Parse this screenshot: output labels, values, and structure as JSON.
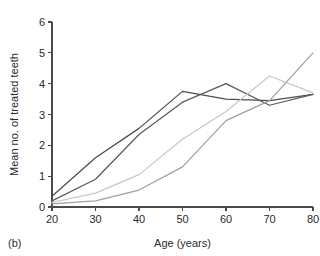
{
  "figure": {
    "panel_label": "(b)"
  },
  "chart_data": {
    "type": "line",
    "title": "",
    "xlabel": "Age (years)",
    "ylabel": "Mean no. of treated teeth",
    "x": [
      20,
      30,
      40,
      50,
      60,
      70,
      80
    ],
    "xlim": [
      20,
      80
    ],
    "ylim": [
      0,
      6
    ],
    "xticks": [
      20,
      30,
      40,
      50,
      60,
      70,
      80
    ],
    "yticks": [
      0,
      1,
      2,
      3,
      4,
      5,
      6
    ],
    "xtick_labels": [
      "20",
      "30",
      "40",
      "50",
      "60",
      "70",
      "80"
    ],
    "ytick_labels": [
      "0",
      "1",
      "2",
      "3",
      "4",
      "5",
      "6"
    ],
    "grid": false,
    "legend": "none",
    "series": [
      {
        "name": "series-1",
        "color": "#4d4d4d",
        "values": [
          0.35,
          1.6,
          2.55,
          3.75,
          3.5,
          3.45,
          3.65
        ]
      },
      {
        "name": "series-2",
        "color": "#5a5a5a",
        "values": [
          0.2,
          0.9,
          2.35,
          3.4,
          4.0,
          3.3,
          3.65
        ]
      },
      {
        "name": "series-3",
        "color": "#c8c8c8",
        "values": [
          0.15,
          0.45,
          1.05,
          2.2,
          3.1,
          4.25,
          3.7
        ]
      },
      {
        "name": "series-4",
        "color": "#a0a0a0",
        "values": [
          0.1,
          0.2,
          0.55,
          1.3,
          2.8,
          3.45,
          5.0
        ]
      }
    ]
  }
}
